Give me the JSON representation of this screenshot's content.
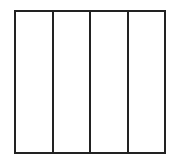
{
  "diagram": {
    "shape": "square",
    "divisions": 4,
    "orientation": "vertical",
    "columns": [
      {
        "index": 1,
        "shaded": false
      },
      {
        "index": 2,
        "shaded": false
      },
      {
        "index": 3,
        "shaded": false
      },
      {
        "index": 4,
        "shaded": false
      }
    ],
    "stroke_color": "#222222",
    "fill_color": "#ffffff"
  }
}
